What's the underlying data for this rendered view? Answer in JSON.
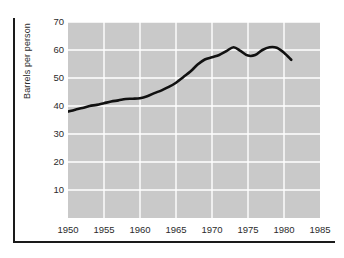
{
  "chart_data": {
    "type": "line",
    "title": "",
    "xlabel": "",
    "ylabel": "Barrels per person",
    "xlim": [
      1950,
      1985
    ],
    "ylim": [
      0,
      70
    ],
    "grid": true,
    "legend": "none",
    "xticks": [
      "1950",
      "1955",
      "1960",
      "1965",
      "1970",
      "1975",
      "1980",
      "1985"
    ],
    "xtick_values": [
      1950,
      1955,
      1960,
      1965,
      1970,
      1975,
      1980,
      1985
    ],
    "yticks": [
      "10",
      "20",
      "30",
      "40",
      "50",
      "60",
      "70"
    ],
    "ytick_values": [
      10,
      20,
      30,
      40,
      50,
      60,
      70
    ],
    "series": [
      {
        "name": "Barrels per person",
        "color": "#111111",
        "x": [
          1950,
          1951,
          1952,
          1953,
          1954,
          1955,
          1956,
          1957,
          1958,
          1959,
          1960,
          1961,
          1962,
          1963,
          1964,
          1965,
          1966,
          1967,
          1968,
          1969,
          1970,
          1971,
          1972,
          1973,
          1974,
          1975,
          1976,
          1977,
          1978,
          1979,
          1980,
          1981
        ],
        "values": [
          38.0,
          38.7,
          39.3,
          40.0,
          40.4,
          41.0,
          41.6,
          42.0,
          42.5,
          42.6,
          42.8,
          43.5,
          44.6,
          45.6,
          46.8,
          48.3,
          50.3,
          52.3,
          54.8,
          56.6,
          57.4,
          58.2,
          59.6,
          61.0,
          59.6,
          58.0,
          58.2,
          60.0,
          61.0,
          60.8,
          59.0,
          56.5
        ]
      }
    ],
    "plot_background": "#c9c9c9",
    "gridline_color": "#ffffff",
    "frame_color": "#1a1a1a"
  }
}
